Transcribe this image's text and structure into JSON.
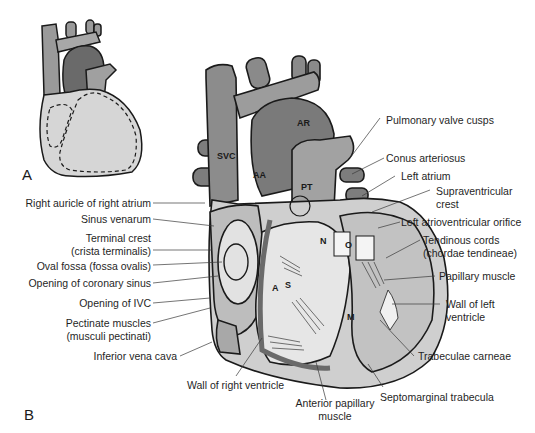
{
  "panels": {
    "a": "A",
    "b": "B"
  },
  "inline_labels": {
    "svc": "SVC",
    "aa": "AA",
    "ar": "AR",
    "pt": "PT",
    "n": "N",
    "o": "O",
    "a": "A",
    "s": "S",
    "m": "M"
  },
  "left_labels": [
    "Right auricle of right atrium",
    "Sinus venarum",
    "Terminal crest",
    "(crista terminalis)",
    "Oval fossa (fossa ovalis)",
    "Opening of coronary sinus",
    "Opening of IVC",
    "Pectinate muscles",
    "(musculi pectinati)",
    "Inferior vena cava"
  ],
  "right_labels": [
    "Pulmonary valve cusps",
    "Conus arteriosus",
    "Left atrium",
    "Supraventricular",
    "crest",
    "Left atrioventricular orifice",
    "Tendinous cords",
    "(chordae tendineae)",
    "Papillary muscle",
    "Wall of left",
    "ventricle",
    "Trabeculae carneae"
  ],
  "bottom_labels": [
    "Wall of right ventricle",
    "Anterior papillary",
    "muscle",
    "Septomarginal trabecula"
  ],
  "colors": {
    "background": "#ffffff",
    "vessel_dark": "#6e6e6e",
    "vessel_mid": "#9a9a9a",
    "heart_light": "#c8c8c8",
    "heart_pale": "#dcdcdc",
    "outline": "#1a1a1a",
    "leader": "#3a3a3a"
  }
}
